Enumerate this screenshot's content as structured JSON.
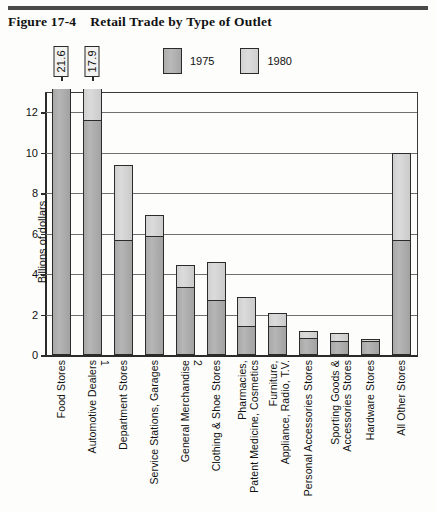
{
  "figure": {
    "number": "Figure 17-4",
    "title": "Retail Trade by Type of Outlet"
  },
  "legend": {
    "items": [
      {
        "label": "1975",
        "color": "#adadad",
        "key": "v1975"
      },
      {
        "label": "1980",
        "color": "#d4d4d4",
        "key": "v1980"
      }
    ]
  },
  "chart_data": {
    "type": "bar",
    "title": "Retail Trade by Type of Outlet",
    "xlabel": "",
    "ylabel": "Billions of dollars",
    "ylim": [
      0,
      13
    ],
    "yticks": [
      0,
      2,
      4,
      6,
      8,
      10,
      12
    ],
    "ytick_labels": [
      "0",
      "2",
      "4",
      "6",
      "8",
      "10",
      "12"
    ],
    "grid": true,
    "legend_position": "top-center",
    "grouping": "overlay (1980 total drawn behind, 1975 drawn in front of lower portion)",
    "categories": [
      "Food Stores",
      "Automotive Dealers",
      "Department Stores",
      "Service Stations, Garages",
      "General Merchandise",
      "Clothing & Shoe Stores",
      "Pharmacies, Patent Medicine, Cosmetics",
      "Furniture, Appliance, Radio, T.V.",
      "Personal Accessories Stores",
      "Sporting Goods & Accessories Stores",
      "Hardware Stores",
      "All Other Stores"
    ],
    "category_labels": [
      "Food Stores",
      "Automotive Dealers¹",
      "Department Stores",
      "Service Stations, Garages",
      "General Merchandise²",
      "Clothing & Shoe Stores",
      "Pharmacies,\nPatent Medicine, Cosmetics",
      "Furniture,\nAppliance, Radio, T.V.",
      "Personal Accessories Stores",
      "Sporting Goods &\nAccessories Stores",
      "Hardware Stores",
      "All Other Stores"
    ],
    "series": [
      {
        "name": "1975",
        "values": [
          13.4,
          11.6,
          5.7,
          5.9,
          3.35,
          2.7,
          1.45,
          1.45,
          0.85,
          0.7,
          0.7,
          5.7
        ]
      },
      {
        "name": "1980",
        "values": [
          21.6,
          17.9,
          9.4,
          6.9,
          4.45,
          4.6,
          2.85,
          2.1,
          1.2,
          1.1,
          0.8,
          10.0
        ]
      }
    ],
    "truncated_bars": [
      {
        "category": "Food Stores",
        "value_label": "21.6",
        "note": "bar broken above axis maximum"
      },
      {
        "category": "Automotive Dealers",
        "value_label": "17.9",
        "note": "bar broken above axis maximum"
      }
    ]
  }
}
